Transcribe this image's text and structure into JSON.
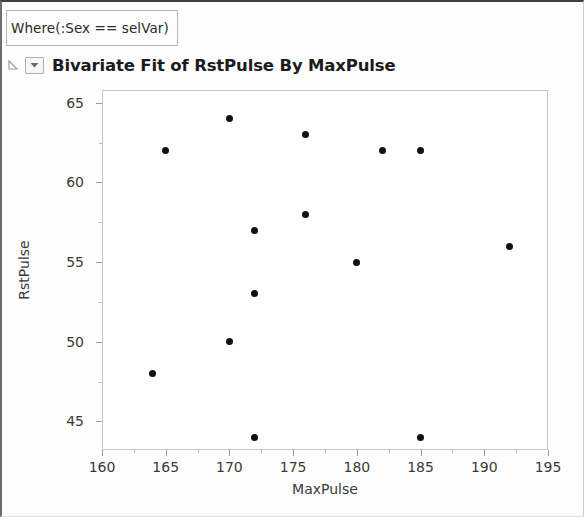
{
  "window": {
    "where_filter": "Where(:Sex == selVar)",
    "outline_title": "Bivariate Fit of RstPulse By MaxPulse",
    "disclosure_icon": "triangle-collapse-icon",
    "menu_icon": "chevron-down-icon"
  },
  "chart_data": {
    "type": "scatter",
    "title": "Bivariate Fit of RstPulse By MaxPulse",
    "xlabel": "MaxPulse",
    "ylabel": "RstPulse",
    "xlim": [
      160,
      195
    ],
    "ylim": [
      43.2,
      65.8
    ],
    "xticks": [
      160,
      165,
      170,
      175,
      180,
      185,
      190,
      195
    ],
    "xtick_labels": [
      "160",
      "165",
      "170",
      "175",
      "180",
      "185",
      "190",
      "195"
    ],
    "yticks": [
      45,
      50,
      55,
      60,
      65
    ],
    "ytick_labels": [
      "45",
      "50",
      "55",
      "60",
      "65"
    ],
    "x_minor_step": 2.5,
    "y_minor_step": 2.5,
    "grid": false,
    "legend": "none",
    "marker": {
      "shape": "circle",
      "color": "#111111",
      "size": 7
    },
    "points": [
      {
        "x": 164,
        "y": 48
      },
      {
        "x": 165,
        "y": 62
      },
      {
        "x": 170,
        "y": 64
      },
      {
        "x": 170,
        "y": 50
      },
      {
        "x": 172,
        "y": 57
      },
      {
        "x": 172,
        "y": 53
      },
      {
        "x": 172,
        "y": 44
      },
      {
        "x": 176,
        "y": 63
      },
      {
        "x": 176,
        "y": 58
      },
      {
        "x": 180,
        "y": 55
      },
      {
        "x": 182,
        "y": 62
      },
      {
        "x": 185,
        "y": 62
      },
      {
        "x": 185,
        "y": 44
      },
      {
        "x": 192,
        "y": 56
      }
    ],
    "n_points": 14
  },
  "colors": {
    "marker": "#111111",
    "frame": "#c6c6c6",
    "axis_text": "#3a3a3a",
    "title_text": "#1c1c1c"
  }
}
